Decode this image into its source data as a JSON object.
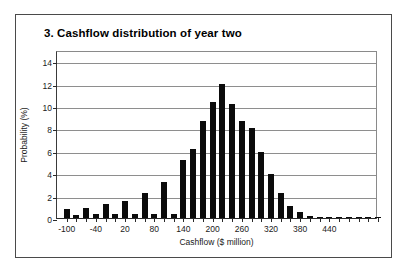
{
  "chart_data": {
    "type": "bar",
    "title": "3. Cashflow distribution of year two",
    "xlabel": "Cashflow ($ million)",
    "ylabel": "Probability (%)",
    "ylim": [
      0,
      15
    ],
    "xlim": [
      -110,
      550
    ],
    "grid": true,
    "legend": false,
    "bar_width": 20,
    "ytick_labels": [
      "0",
      "2",
      "4",
      "6",
      "8",
      "10",
      "12",
      "14"
    ],
    "ytick_values": [
      0,
      2,
      4,
      6,
      8,
      10,
      12,
      14
    ],
    "xtick_labels": [
      "-100",
      "-40",
      "20",
      "80",
      "140",
      "200",
      "260",
      "320",
      "380",
      "440"
    ],
    "xtick_values": [
      -100,
      -40,
      20,
      80,
      140,
      200,
      260,
      320,
      380,
      440
    ],
    "categories": [
      -100,
      -80,
      -60,
      -40,
      -20,
      0,
      20,
      40,
      60,
      80,
      100,
      120,
      140,
      160,
      180,
      200,
      220,
      240,
      260,
      280,
      300,
      320,
      340,
      360,
      380,
      400,
      420,
      440,
      460,
      480,
      500,
      520,
      540
    ],
    "values": [
      0.8,
      0.3,
      0.9,
      0.4,
      1.25,
      0.4,
      1.5,
      0.4,
      2.2,
      0.4,
      3.2,
      0.4,
      5.15,
      6.2,
      8.65,
      10.35,
      12.0,
      10.2,
      8.7,
      8.0,
      5.9,
      3.9,
      2.2,
      1.05,
      0.5,
      0.2,
      0.1,
      0.1,
      0.05,
      0.05,
      0.05,
      0.05,
      0.05
    ],
    "series": [
      {
        "name": "Probability",
        "points": [
          {
            "x": -100,
            "y": 0.8
          },
          {
            "x": -80,
            "y": 0.9
          },
          {
            "x": -60,
            "y": 1.25
          },
          {
            "x": -40,
            "y": 1.5
          },
          {
            "x": -20,
            "y": 2.2
          },
          {
            "x": 0,
            "y": 3.2
          },
          {
            "x": 20,
            "y": 5.15
          },
          {
            "x": 40,
            "y": 6.2
          },
          {
            "x": 60,
            "y": 8.65
          },
          {
            "x": 80,
            "y": 10.35
          },
          {
            "x": 100,
            "y": 12.0
          },
          {
            "x": 120,
            "y": 10.2
          },
          {
            "x": 140,
            "y": 8.7
          },
          {
            "x": 160,
            "y": 8.0
          },
          {
            "x": 180,
            "y": 5.9
          },
          {
            "x": 200,
            "y": 3.9
          },
          {
            "x": 220,
            "y": 2.2
          },
          {
            "x": 240,
            "y": 1.05
          },
          {
            "x": 260,
            "y": 0.5
          },
          {
            "x": 280,
            "y": 0.2
          }
        ]
      }
    ],
    "bars": [
      {
        "label": "-100",
        "value": 0.8
      },
      {
        "label": "-80",
        "value": 0.9
      },
      {
        "label": "-60",
        "value": 1.25
      },
      {
        "label": "-40",
        "value": 1.5
      },
      {
        "label": "-20",
        "value": 2.2
      },
      {
        "label": "0",
        "value": 3.2
      },
      {
        "label": "20",
        "value": 5.15
      },
      {
        "label": "40",
        "value": 6.2
      },
      {
        "label": "60",
        "value": 8.65
      },
      {
        "label": "80",
        "value": 10.35
      },
      {
        "label": "100",
        "value": 12.0
      },
      {
        "label": "120",
        "value": 10.2
      },
      {
        "label": "140",
        "value": 8.7
      },
      {
        "label": "160",
        "value": 8.0
      },
      {
        "label": "180",
        "value": 5.9
      },
      {
        "label": "200",
        "value": 3.9
      },
      {
        "label": "220",
        "value": 2.2
      },
      {
        "label": "240",
        "value": 1.05
      },
      {
        "label": "260",
        "value": 0.5
      },
      {
        "label": "280",
        "value": 0.2
      }
    ],
    "colors": {
      "bar": "#0b0b0b",
      "grid": "#8e8e8e",
      "axis": "#2a2a2a",
      "text": "#1a1a1a",
      "frame": "#4a4a4a",
      "background": "#ffffff"
    }
  }
}
